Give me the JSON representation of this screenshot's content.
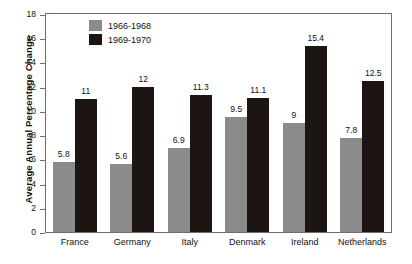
{
  "chart_data": {
    "type": "bar",
    "title": "",
    "xlabel": "",
    "ylabel": "Average Annual Percentage Change",
    "ylim": [
      0,
      18
    ],
    "ytick_step": 2,
    "yticks": [
      "0",
      "2",
      "4",
      "6",
      "8",
      "10",
      "12",
      "14",
      "16",
      "18"
    ],
    "grid": false,
    "legend_position": "top-left-inside",
    "categories": [
      "France",
      "Germany",
      "Italy",
      "Denmark",
      "Ireland",
      "Netherlands"
    ],
    "series": [
      {
        "name": "1966-1968",
        "color": "#8b8b8b",
        "values": [
          5.8,
          5.6,
          6.9,
          9.5,
          9,
          7.8
        ],
        "labels": [
          "5.8",
          "5.6",
          "6.9",
          "9.5",
          "9",
          "7.8"
        ]
      },
      {
        "name": "1969-1970",
        "color": "#1d1512",
        "values": [
          11,
          12,
          11.3,
          11.1,
          15.4,
          12.5
        ],
        "labels": [
          "11",
          "12",
          "11.3",
          "11.1",
          "15.4",
          "12.5"
        ]
      }
    ]
  }
}
